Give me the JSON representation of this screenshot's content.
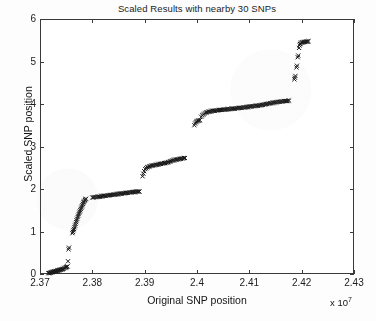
{
  "figure": {
    "background_color": "#fdfdfd",
    "axes_background_color": "#ffffff",
    "axis_color": "#3a3a3a",
    "marker_color": "#1a1a1a"
  },
  "chart_data": {
    "type": "scatter",
    "title": "Scaled Results with nearby 30 SNPs",
    "xlabel": "Original SNP position",
    "ylabel": "Scaled SNP position",
    "x_exponent_label": "x 10",
    "x_exponent_power": "7",
    "x_exponent_multiplier": 10000000,
    "grid": false,
    "legend": null,
    "marker": "x",
    "marker_size": 3,
    "xlim": [
      23700000,
      24300000
    ],
    "ylim": [
      0,
      6
    ],
    "xticks": [
      2.37,
      2.38,
      2.39,
      2.4,
      2.41,
      2.42,
      2.43
    ],
    "xtick_labels": [
      "2.37",
      "2.38",
      "2.39",
      "2.4",
      "2.41",
      "2.42",
      "2.43"
    ],
    "yticks": [
      0,
      1,
      2,
      3,
      4,
      5,
      6
    ],
    "ytick_labels": [
      "0",
      "1",
      "2",
      "3",
      "4",
      "5",
      "6"
    ],
    "points": [
      [
        23716000,
        0.02
      ],
      [
        23717500,
        0.02
      ],
      [
        23719000,
        0.03
      ],
      [
        23720500,
        0.03
      ],
      [
        23722000,
        0.04
      ],
      [
        23723000,
        0.04
      ],
      [
        23724000,
        0.05
      ],
      [
        23725000,
        0.05
      ],
      [
        23726000,
        0.05
      ],
      [
        23727000,
        0.06
      ],
      [
        23728000,
        0.06
      ],
      [
        23729000,
        0.06
      ],
      [
        23730000,
        0.07
      ],
      [
        23731000,
        0.07
      ],
      [
        23732000,
        0.07
      ],
      [
        23733000,
        0.08
      ],
      [
        23734000,
        0.08
      ],
      [
        23735000,
        0.08
      ],
      [
        23736000,
        0.09
      ],
      [
        23737000,
        0.09
      ],
      [
        23738000,
        0.1
      ],
      [
        23739500,
        0.1
      ],
      [
        23741000,
        0.11
      ],
      [
        23742500,
        0.11
      ],
      [
        23744000,
        0.12
      ],
      [
        23745500,
        0.13
      ],
      [
        23747000,
        0.14
      ],
      [
        23748500,
        0.15
      ],
      [
        23750000,
        0.16
      ],
      [
        23751500,
        0.17
      ],
      [
        23752500,
        0.18
      ],
      [
        23753500,
        0.3
      ],
      [
        23754500,
        0.58
      ],
      [
        23755500,
        0.62
      ],
      [
        23762000,
        0.96
      ],
      [
        23763000,
        0.99
      ],
      [
        23764000,
        1.03
      ],
      [
        23765000,
        1.06
      ],
      [
        23766000,
        1.1
      ],
      [
        23767000,
        1.14
      ],
      [
        23768000,
        1.18
      ],
      [
        23769000,
        1.22
      ],
      [
        23770000,
        1.26
      ],
      [
        23771000,
        1.3
      ],
      [
        23772000,
        1.34
      ],
      [
        23773000,
        1.37
      ],
      [
        23774000,
        1.41
      ],
      [
        23775000,
        1.44
      ],
      [
        23776000,
        1.47
      ],
      [
        23777000,
        1.5
      ],
      [
        23778000,
        1.53
      ],
      [
        23779000,
        1.56
      ],
      [
        23780000,
        1.59
      ],
      [
        23781000,
        1.62
      ],
      [
        23782000,
        1.65
      ],
      [
        23783000,
        1.68
      ],
      [
        23784000,
        1.7
      ],
      [
        23785000,
        1.72
      ],
      [
        23786000,
        1.74
      ],
      [
        23787000,
        1.76
      ],
      [
        23788000,
        1.77
      ],
      [
        23800000,
        1.8
      ],
      [
        23802000,
        1.8
      ],
      [
        23804000,
        1.81
      ],
      [
        23806000,
        1.81
      ],
      [
        23808000,
        1.81
      ],
      [
        23810000,
        1.82
      ],
      [
        23812000,
        1.82
      ],
      [
        23814000,
        1.82
      ],
      [
        23816000,
        1.83
      ],
      [
        23818000,
        1.83
      ],
      [
        23820000,
        1.83
      ],
      [
        23822000,
        1.84
      ],
      [
        23824000,
        1.84
      ],
      [
        23826000,
        1.84
      ],
      [
        23828000,
        1.85
      ],
      [
        23830000,
        1.85
      ],
      [
        23832000,
        1.85
      ],
      [
        23834000,
        1.86
      ],
      [
        23836000,
        1.86
      ],
      [
        23838000,
        1.86
      ],
      [
        23840000,
        1.87
      ],
      [
        23842000,
        1.87
      ],
      [
        23844000,
        1.87
      ],
      [
        23846000,
        1.88
      ],
      [
        23848000,
        1.88
      ],
      [
        23850000,
        1.88
      ],
      [
        23852000,
        1.89
      ],
      [
        23854000,
        1.89
      ],
      [
        23856000,
        1.89
      ],
      [
        23858000,
        1.9
      ],
      [
        23860000,
        1.9
      ],
      [
        23862000,
        1.9
      ],
      [
        23864000,
        1.91
      ],
      [
        23866000,
        1.91
      ],
      [
        23868000,
        1.91
      ],
      [
        23870000,
        1.92
      ],
      [
        23872000,
        1.92
      ],
      [
        23874000,
        1.92
      ],
      [
        23876000,
        1.93
      ],
      [
        23878000,
        1.93
      ],
      [
        23880000,
        1.93
      ],
      [
        23882000,
        1.93
      ],
      [
        23884000,
        1.94
      ],
      [
        23886000,
        1.94
      ],
      [
        23888000,
        1.94
      ],
      [
        23890000,
        1.94
      ],
      [
        23896000,
        2.3
      ],
      [
        23897500,
        2.36
      ],
      [
        23899000,
        2.42
      ],
      [
        23901000,
        2.47
      ],
      [
        23903000,
        2.49
      ],
      [
        23905000,
        2.51
      ],
      [
        23907000,
        2.52
      ],
      [
        23909000,
        2.53
      ],
      [
        23911000,
        2.54
      ],
      [
        23913000,
        2.55
      ],
      [
        23915000,
        2.55
      ],
      [
        23917000,
        2.56
      ],
      [
        23919000,
        2.56
      ],
      [
        23921000,
        2.57
      ],
      [
        23923000,
        2.57
      ],
      [
        23925000,
        2.58
      ],
      [
        23927000,
        2.58
      ],
      [
        23929000,
        2.59
      ],
      [
        23931000,
        2.59
      ],
      [
        23933000,
        2.6
      ],
      [
        23935000,
        2.6
      ],
      [
        23937000,
        2.61
      ],
      [
        23939000,
        2.61
      ],
      [
        23941000,
        2.62
      ],
      [
        23943000,
        2.62
      ],
      [
        23945000,
        2.63
      ],
      [
        23947000,
        2.64
      ],
      [
        23949000,
        2.65
      ],
      [
        23951000,
        2.66
      ],
      [
        23953000,
        2.67
      ],
      [
        23955000,
        2.68
      ],
      [
        23957000,
        2.68
      ],
      [
        23959000,
        2.69
      ],
      [
        23961000,
        2.69
      ],
      [
        23963000,
        2.7
      ],
      [
        23965000,
        2.7
      ],
      [
        23967000,
        2.71
      ],
      [
        23969000,
        2.71
      ],
      [
        23971000,
        2.72
      ],
      [
        23973000,
        2.72
      ],
      [
        23975000,
        2.73
      ],
      [
        23977000,
        2.73
      ],
      [
        23995000,
        3.5
      ],
      [
        23996500,
        3.54
      ],
      [
        23998000,
        3.57
      ],
      [
        23999500,
        3.59
      ],
      [
        24001000,
        3.6
      ],
      [
        24002500,
        3.61
      ],
      [
        24004000,
        3.61
      ],
      [
        24005500,
        3.62
      ],
      [
        24008000,
        3.7
      ],
      [
        24010000,
        3.73
      ],
      [
        24012000,
        3.75
      ],
      [
        24014000,
        3.77
      ],
      [
        24016000,
        3.79
      ],
      [
        24018000,
        3.8
      ],
      [
        24020000,
        3.81
      ],
      [
        24022000,
        3.82
      ],
      [
        24024000,
        3.82
      ],
      [
        24026000,
        3.83
      ],
      [
        24028000,
        3.83
      ],
      [
        24030000,
        3.84
      ],
      [
        24032000,
        3.84
      ],
      [
        24034000,
        3.84
      ],
      [
        24036000,
        3.85
      ],
      [
        24038000,
        3.85
      ],
      [
        24040000,
        3.85
      ],
      [
        24042000,
        3.86
      ],
      [
        24044000,
        3.86
      ],
      [
        24046000,
        3.86
      ],
      [
        24048000,
        3.86
      ],
      [
        24050000,
        3.87
      ],
      [
        24052000,
        3.87
      ],
      [
        24054000,
        3.87
      ],
      [
        24056000,
        3.87
      ],
      [
        24058000,
        3.88
      ],
      [
        24060000,
        3.88
      ],
      [
        24062000,
        3.88
      ],
      [
        24064000,
        3.88
      ],
      [
        24066000,
        3.89
      ],
      [
        24068000,
        3.89
      ],
      [
        24070000,
        3.89
      ],
      [
        24072000,
        3.89
      ],
      [
        24074000,
        3.9
      ],
      [
        24076000,
        3.9
      ],
      [
        24078000,
        3.9
      ],
      [
        24080000,
        3.91
      ],
      [
        24082000,
        3.91
      ],
      [
        24084000,
        3.91
      ],
      [
        24086000,
        3.91
      ],
      [
        24088000,
        3.92
      ],
      [
        24090000,
        3.92
      ],
      [
        24092000,
        3.92
      ],
      [
        24094000,
        3.93
      ],
      [
        24096000,
        3.93
      ],
      [
        24098000,
        3.93
      ],
      [
        24100000,
        3.94
      ],
      [
        24102000,
        3.94
      ],
      [
        24104000,
        3.94
      ],
      [
        24106000,
        3.95
      ],
      [
        24108000,
        3.95
      ],
      [
        24110000,
        3.95
      ],
      [
        24112000,
        3.96
      ],
      [
        24114000,
        3.96
      ],
      [
        24116000,
        3.96
      ],
      [
        24118000,
        3.97
      ],
      [
        24120000,
        3.97
      ],
      [
        24122000,
        3.97
      ],
      [
        24124000,
        3.98
      ],
      [
        24126000,
        3.98
      ],
      [
        24128000,
        3.99
      ],
      [
        24130000,
        3.99
      ],
      [
        24132000,
        4.0
      ],
      [
        24134000,
        4.0
      ],
      [
        24136000,
        4.01
      ],
      [
        24138000,
        4.01
      ],
      [
        24140000,
        4.02
      ],
      [
        24142000,
        4.02
      ],
      [
        24144000,
        4.03
      ],
      [
        24146000,
        4.03
      ],
      [
        24148000,
        4.03
      ],
      [
        24150000,
        4.04
      ],
      [
        24152000,
        4.04
      ],
      [
        24154000,
        4.05
      ],
      [
        24156000,
        4.05
      ],
      [
        24158000,
        4.05
      ],
      [
        24160000,
        4.06
      ],
      [
        24162000,
        4.06
      ],
      [
        24164000,
        4.06
      ],
      [
        24166000,
        4.07
      ],
      [
        24168000,
        4.07
      ],
      [
        24170000,
        4.07
      ],
      [
        24172000,
        4.07
      ],
      [
        24174000,
        4.08
      ],
      [
        24176000,
        4.08
      ],
      [
        24186000,
        4.58
      ],
      [
        24187000,
        4.62
      ],
      [
        24188000,
        4.66
      ],
      [
        24190000,
        4.86
      ],
      [
        24191000,
        4.9
      ],
      [
        24192500,
        5.1
      ],
      [
        24193500,
        5.14
      ],
      [
        24195000,
        5.32
      ],
      [
        24196000,
        5.38
      ],
      [
        24197000,
        5.41
      ],
      [
        24198000,
        5.43
      ],
      [
        24199500,
        5.44
      ],
      [
        24201000,
        5.45
      ],
      [
        24202500,
        5.45
      ],
      [
        24204000,
        5.46
      ],
      [
        24205500,
        5.46
      ],
      [
        24207000,
        5.46
      ],
      [
        24208500,
        5.47
      ],
      [
        24210000,
        5.47
      ],
      [
        24211500,
        5.47
      ],
      [
        24213000,
        5.48
      ]
    ]
  }
}
